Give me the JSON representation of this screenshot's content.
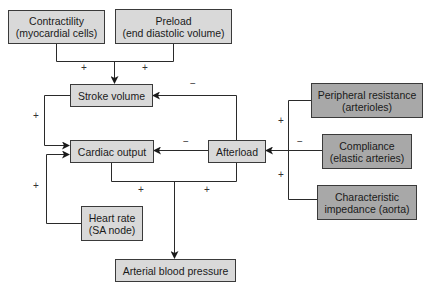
{
  "diagram": {
    "title": "",
    "colors": {
      "light_box": "#d9d9d9",
      "dark_box": "#a8a8a8",
      "line": "#2a2a2a"
    },
    "nodes": {
      "contractility": {
        "label": "Contractility\n(myocardial cells)"
      },
      "preload": {
        "label": "Preload\n(end diastolic volume)"
      },
      "stroke_volume": {
        "label": "Stroke volume"
      },
      "cardiac_output": {
        "label": "Cardiac output"
      },
      "afterload": {
        "label": "Afterload"
      },
      "heart_rate": {
        "label": "Heart rate\n(SA node)"
      },
      "arterial_blood_pressure": {
        "label": "Arterial blood pressure"
      },
      "peripheral_resistance": {
        "label": "Peripheral resistance\n(arterioles)"
      },
      "compliance": {
        "label": "Compliance\n(elastic arteries)"
      },
      "characteristic_impedance": {
        "label": "Characteristic\nimpedance (aorta)"
      }
    },
    "edges": [
      {
        "from": "contractility",
        "to": "stroke_volume",
        "sign": "+"
      },
      {
        "from": "preload",
        "to": "stroke_volume",
        "sign": "+"
      },
      {
        "from": "afterload",
        "to": "stroke_volume",
        "sign": "−"
      },
      {
        "from": "stroke_volume",
        "to": "cardiac_output",
        "sign": "+"
      },
      {
        "from": "heart_rate",
        "to": "cardiac_output",
        "sign": "+"
      },
      {
        "from": "afterload",
        "to": "cardiac_output",
        "sign": "−"
      },
      {
        "from": "cardiac_output",
        "to": "arterial_blood_pressure",
        "sign": "+"
      },
      {
        "from": "afterload",
        "to": "arterial_blood_pressure",
        "sign": "+"
      },
      {
        "from": "peripheral_resistance",
        "to": "afterload",
        "sign": "+"
      },
      {
        "from": "compliance",
        "to": "afterload",
        "sign": "−"
      },
      {
        "from": "characteristic_impedance",
        "to": "afterload",
        "sign": "+"
      }
    ],
    "signs": {
      "contractility_sv": "+",
      "preload_sv": "+",
      "afterload_sv": "−",
      "sv_co": "+",
      "hr_co": "+",
      "afterload_co": "−",
      "co_abp": "+",
      "afterload_abp": "+",
      "pr_afterload": "+",
      "compliance_afterload": "−",
      "ci_afterload": "+"
    }
  }
}
